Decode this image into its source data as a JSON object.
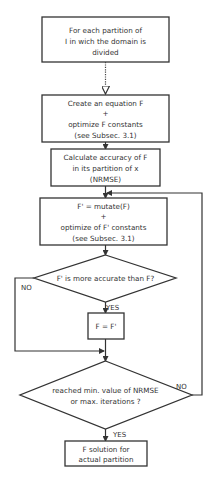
{
  "diagram": {
    "type": "flowchart",
    "nodes": {
      "start": {
        "lines": [
          "For each partition of",
          "I in wich the domain is",
          "divided"
        ]
      },
      "create": {
        "lines": [
          "Create an equation F",
          "+",
          "optimize F constants",
          "(see Subsec. 3.1)"
        ]
      },
      "calc": {
        "lines": [
          "Calculate accuracy of F",
          "in its partition of x",
          "(NRMSE)"
        ]
      },
      "mutate": {
        "lines": [
          "F' = mutate(F)",
          "+",
          "optimize of F' constants",
          "(see Subsec. 3.1)"
        ]
      },
      "decision1": {
        "lines": [
          "F' is more accurate than F?"
        ]
      },
      "assign": {
        "lines": [
          "F = F'"
        ]
      },
      "decision2": {
        "lines": [
          "reached min. value of NRMSE",
          "or max. iterations ?"
        ]
      },
      "end": {
        "lines": [
          "F solution for",
          "actual partition"
        ]
      }
    },
    "edge_labels": {
      "d1_yes": "YES",
      "d1_no": "NO",
      "d2_yes": "YES",
      "d2_no": "NO"
    }
  }
}
